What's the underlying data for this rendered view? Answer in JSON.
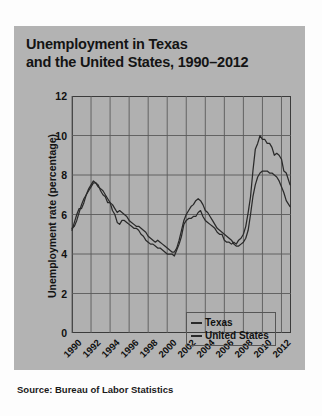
{
  "figure": {
    "title_line1": "Unemployment in Texas",
    "title_line2": "and the United States, 1990–2012",
    "source": "Source: Bureau of Labor Statistics",
    "panel_color": "#b3b3b3",
    "plot_color": "#b0b0b0",
    "line_color": "#2a2a2a",
    "grid_color": "#5a5a5a"
  },
  "chart_data": {
    "type": "line",
    "title": "Unemployment in Texas and the United States, 1990–2012",
    "xlabel": "",
    "ylabel": "Unemployment rate (percentage)",
    "xlim": [
      1990,
      2013
    ],
    "ylim": [
      0,
      12
    ],
    "yticks": [
      0,
      2,
      4,
      6,
      8,
      10,
      12
    ],
    "xticks": [
      1990,
      1992,
      1994,
      1996,
      1998,
      2000,
      2002,
      2004,
      2006,
      2008,
      2010,
      2012
    ],
    "ytick_labels": [
      "0",
      "2",
      "4",
      "6",
      "8",
      "10",
      "12"
    ],
    "xtick_labels": [
      "1990",
      "1992",
      "1994",
      "1996",
      "1998",
      "2000",
      "2002",
      "2004",
      "2006",
      "2008",
      "2010",
      "2012"
    ],
    "grid": true,
    "legend_position": "bottom-center",
    "x": [
      1990.0,
      1990.25,
      1990.5,
      1990.75,
      1991.0,
      1991.25,
      1991.5,
      1991.75,
      1992.0,
      1992.25,
      1992.5,
      1992.75,
      1993.0,
      1993.25,
      1993.5,
      1993.75,
      1994.0,
      1994.25,
      1994.5,
      1994.75,
      1995.0,
      1995.25,
      1995.5,
      1995.75,
      1996.0,
      1996.25,
      1996.5,
      1996.75,
      1997.0,
      1997.25,
      1997.5,
      1997.75,
      1998.0,
      1998.25,
      1998.5,
      1998.75,
      1999.0,
      1999.25,
      1999.5,
      1999.75,
      2000.0,
      2000.25,
      2000.5,
      2000.75,
      2001.0,
      2001.25,
      2001.5,
      2001.75,
      2002.0,
      2002.25,
      2002.5,
      2002.75,
      2003.0,
      2003.25,
      2003.5,
      2003.75,
      2004.0,
      2004.25,
      2004.5,
      2004.75,
      2005.0,
      2005.25,
      2005.5,
      2005.75,
      2006.0,
      2006.25,
      2006.5,
      2006.75,
      2007.0,
      2007.25,
      2007.5,
      2007.75,
      2008.0,
      2008.25,
      2008.5,
      2008.75,
      2009.0,
      2009.25,
      2009.5,
      2009.75,
      2010.0,
      2010.25,
      2010.5,
      2010.75,
      2011.0,
      2011.25,
      2011.5,
      2011.75,
      2012.0,
      2012.25,
      2012.5,
      2012.9
    ],
    "series": [
      {
        "name": "Texas",
        "values": [
          5.2,
          5.6,
          6.0,
          6.3,
          6.3,
          6.6,
          7.0,
          7.3,
          7.5,
          7.7,
          7.6,
          7.4,
          7.3,
          7.2,
          7.0,
          6.8,
          6.6,
          6.5,
          6.3,
          6.1,
          6.2,
          6.1,
          6.0,
          5.9,
          5.7,
          5.6,
          5.5,
          5.4,
          5.4,
          5.3,
          5.2,
          5.1,
          4.9,
          4.8,
          4.7,
          4.6,
          4.7,
          4.6,
          4.5,
          4.4,
          4.3,
          4.2,
          4.1,
          4.1,
          4.3,
          4.7,
          5.2,
          5.7,
          6.0,
          6.2,
          6.4,
          6.5,
          6.7,
          6.8,
          6.7,
          6.5,
          6.2,
          6.1,
          5.9,
          5.7,
          5.5,
          5.3,
          5.2,
          5.1,
          5.0,
          4.9,
          4.8,
          4.7,
          4.5,
          4.4,
          4.4,
          4.5,
          4.6,
          4.8,
          5.2,
          6.0,
          6.9,
          7.5,
          7.9,
          8.1,
          8.2,
          8.2,
          8.2,
          8.1,
          8.1,
          8.0,
          7.9,
          7.7,
          7.4,
          7.1,
          6.7,
          6.4
        ]
      },
      {
        "name": "United States",
        "values": [
          5.3,
          5.4,
          5.7,
          6.1,
          6.5,
          6.8,
          7.0,
          7.2,
          7.4,
          7.6,
          7.6,
          7.5,
          7.2,
          7.0,
          6.9,
          6.6,
          6.6,
          6.2,
          6.0,
          5.6,
          5.5,
          5.7,
          5.7,
          5.6,
          5.5,
          5.4,
          5.3,
          5.3,
          5.2,
          5.0,
          4.9,
          4.7,
          4.6,
          4.5,
          4.5,
          4.4,
          4.3,
          4.3,
          4.2,
          4.1,
          4.0,
          4.0,
          4.0,
          3.9,
          4.2,
          4.5,
          4.9,
          5.5,
          5.7,
          5.8,
          5.8,
          5.9,
          5.9,
          6.1,
          6.2,
          5.9,
          5.7,
          5.6,
          5.5,
          5.4,
          5.3,
          5.1,
          5.0,
          5.0,
          4.7,
          4.6,
          4.6,
          4.5,
          4.6,
          4.5,
          4.7,
          4.8,
          5.0,
          5.4,
          6.1,
          6.9,
          8.2,
          9.3,
          9.6,
          10.0,
          9.8,
          9.8,
          9.6,
          9.6,
          9.4,
          9.0,
          9.1,
          9.0,
          8.8,
          8.2,
          8.1,
          7.5
        ]
      }
    ]
  },
  "legend": {
    "items": [
      {
        "label": "Texas"
      },
      {
        "label": "United States"
      }
    ]
  }
}
